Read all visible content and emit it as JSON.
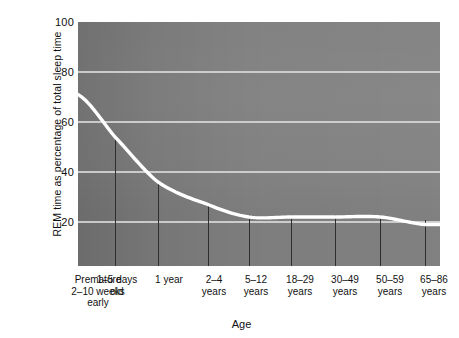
{
  "chart_data": {
    "type": "line",
    "title": "",
    "xlabel": "Age",
    "ylabel": "REM time as percentage of total sleep time",
    "ylim": [
      0,
      100
    ],
    "yticks": [
      20,
      40,
      60,
      80,
      100
    ],
    "grid": true,
    "legend": "none",
    "line_color": "#ffffff",
    "plot_background": "#7c7c7c",
    "categories": [
      "Premature\n2–10 weeks\nearly",
      "1–5 days\nold",
      "1 year",
      "2–4\nyears",
      "5–12\nyears",
      "18–29\nyears",
      "30–49\nyears",
      "50–59\nyears",
      "65–86\nyears"
    ],
    "category_lines": [
      [
        "Premature",
        "2–10 weeks",
        "early"
      ],
      [
        "1–5 days",
        "old"
      ],
      [
        "1 year"
      ],
      [
        "2–4",
        "years"
      ],
      [
        "5–12",
        "years"
      ],
      [
        "18–29",
        "years"
      ],
      [
        "30–49",
        "years"
      ],
      [
        "50–59",
        "years"
      ],
      [
        "65–86",
        "years"
      ]
    ],
    "values": [
      71,
      54,
      36,
      27,
      22,
      22,
      22,
      22,
      19
    ],
    "series": [
      {
        "name": "REM time as percentage of total sleep time",
        "values": [
          71,
          54,
          36,
          27,
          22,
          22,
          22,
          22,
          19
        ]
      }
    ],
    "annotations": []
  },
  "axis": {
    "y_tick_labels": [
      "100",
      "80",
      "60",
      "40",
      "20"
    ],
    "y_title": "REM time as percentage of total sleep time",
    "x_title": "Age"
  }
}
